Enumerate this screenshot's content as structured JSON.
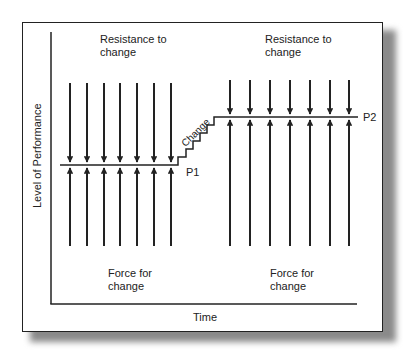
{
  "diagram": {
    "axes": {
      "y_label": "Level of Performance",
      "x_label": "Time"
    },
    "left_group": {
      "top_label_line1": "Resistance to",
      "top_label_line2": "change",
      "bottom_label_line1": "Force for",
      "bottom_label_line2": "change",
      "point_label": "P1",
      "arrow_count": 7
    },
    "right_group": {
      "top_label_line1": "Resistance to",
      "top_label_line2": "change",
      "bottom_label_line1": "Force for",
      "bottom_label_line2": "change",
      "point_label": "P2",
      "arrow_count": 7
    },
    "transition_label": "Change",
    "colors": {
      "line": "#222222",
      "background": "#ffffff",
      "shadow": "#8a8a8a"
    }
  }
}
